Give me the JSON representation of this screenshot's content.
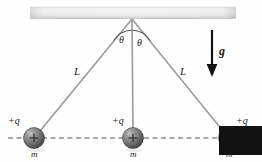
{
  "figure": {
    "background_color": "#fefefe",
    "width": 262,
    "height": 162
  },
  "ceiling": {
    "name": "ceiling-bar",
    "x": 30,
    "y": 7,
    "width": 206,
    "height": 11,
    "fill_light": "#f2f2f2",
    "fill_mid": "#d9d9d9",
    "fill_dark": "#bdbdbd"
  },
  "pivot": {
    "x": 132,
    "y": 19
  },
  "strings": {
    "color": "#9a9a9a",
    "width": 1.6,
    "left": {
      "name": "string-left",
      "x1": 132,
      "y1": 19,
      "x2": 40,
      "y2": 131
    },
    "middle": {
      "name": "string-middle",
      "x1": 132,
      "y1": 19,
      "x2": 133,
      "y2": 130
    },
    "right": {
      "name": "string-right",
      "x1": 132,
      "y1": 19,
      "x2": 223,
      "y2": 131
    }
  },
  "length_labels": [
    {
      "text": "L",
      "x": 74,
      "y": 66
    },
    {
      "text": "L",
      "x": 180,
      "y": 66
    }
  ],
  "angle_labels": [
    {
      "text": "θ",
      "x": 119,
      "y": 35
    },
    {
      "text": "θ",
      "x": 137,
      "y": 38
    }
  ],
  "angle_arcs": {
    "color": "#3a3a3a",
    "width": 0.9,
    "left": "M 113.8 40.5 A 22 22 0 0 1 131.6 30.2",
    "right": "M 132.6 30.2 A 22 22 0 0 1 150.2 40.6"
  },
  "dashed_line": {
    "name": "horizontal-reference-line",
    "x1": 8,
    "x2": 255,
    "y": 138,
    "color": "#55555a",
    "dash": "5,3.5",
    "width": 1
  },
  "spheres": [
    {
      "name": "sphere-left",
      "cx": 34,
      "cy": 138,
      "r": 10.5,
      "charge_label": "+q",
      "charge_x": 8,
      "charge_y": 116,
      "mass_label": "m",
      "mass_x": 31,
      "mass_y": 150,
      "plus_sign": "+"
    },
    {
      "name": "sphere-middle",
      "cx": 133,
      "cy": 138,
      "r": 10.5,
      "charge_label": "+q",
      "charge_x": 112,
      "charge_y": 116,
      "mass_label": "m",
      "mass_x": 130,
      "mass_y": 150,
      "plus_sign": "+"
    },
    {
      "name": "sphere-right",
      "cx": 229,
      "cy": 138,
      "r": 10.5,
      "charge_label": "+q",
      "charge_x": 236,
      "charge_y": 116,
      "mass_label": "m",
      "mass_x": 226,
      "mass_y": 150,
      "plus_sign": "+"
    }
  ],
  "sphere_style": {
    "highlight": "#b6b6b6",
    "mid": "#7e7e7e",
    "dark": "#4a4a4a",
    "edge": "#3c3c3c",
    "plus_color": "#2a2a2a"
  },
  "gravity": {
    "name": "gravity-arrow",
    "color": "#121212",
    "shaft_x": 212,
    "shaft_y1": 30,
    "shaft_y2": 66,
    "shaft_width": 2.2,
    "head_points": "206.6,64 217.4,64 212,77",
    "label": "g",
    "label_x": 219,
    "label_y": 45
  }
}
